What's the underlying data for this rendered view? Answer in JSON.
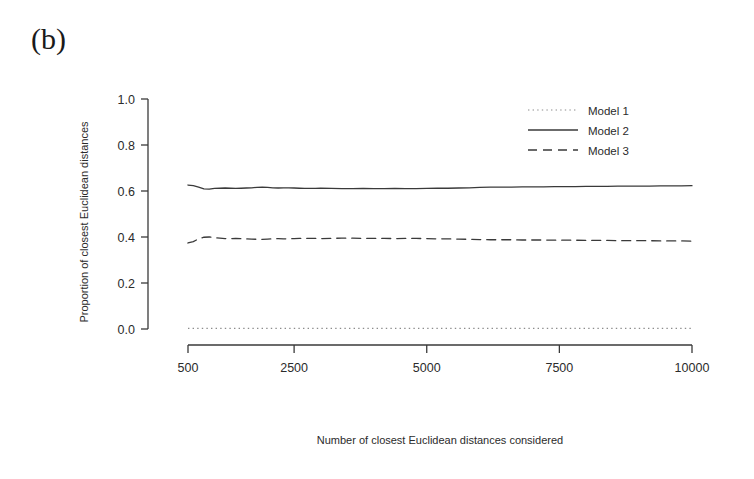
{
  "figure": {
    "panel_label": "(b)",
    "background_color": "#ffffff",
    "ink_color": "#3a3a3a"
  },
  "chart_data": {
    "type": "line",
    "title": "",
    "subtitle": "",
    "xlabel": "Number of closest Euclidean distances considered",
    "ylabel": "Proportion of closest Euclidean distances",
    "xlim": [
      500,
      10000
    ],
    "ylim": [
      0.0,
      1.0
    ],
    "grid": false,
    "legend_position": "top-right",
    "xticks": [
      500,
      2500,
      5000,
      7500,
      10000
    ],
    "xtick_labels": [
      "500",
      "2500",
      "5000",
      "7500",
      "10000"
    ],
    "yticks": [
      0.0,
      0.2,
      0.4,
      0.6,
      0.8,
      1.0
    ],
    "ytick_labels": [
      "0.0",
      "0.2",
      "0.4",
      "0.6",
      "0.8",
      "1.0"
    ],
    "x": [
      500,
      600,
      700,
      800,
      900,
      1000,
      1100,
      1200,
      1300,
      1400,
      1500,
      1600,
      1700,
      1800,
      1900,
      2000,
      2100,
      2200,
      2300,
      2400,
      2500,
      2600,
      2700,
      2800,
      2900,
      3000,
      3200,
      3400,
      3600,
      3800,
      4000,
      4200,
      4400,
      4600,
      4800,
      5000,
      5200,
      5400,
      5600,
      5800,
      6000,
      6200,
      6400,
      6600,
      6800,
      7000,
      7200,
      7400,
      7600,
      7800,
      8000,
      8200,
      8400,
      8600,
      8800,
      9000,
      9200,
      9400,
      9600,
      9800,
      10000
    ],
    "series": [
      {
        "name": "Model 1",
        "style": "dotted",
        "color": "#8c8c8c",
        "values": [
          0.003,
          0.003,
          0.003,
          0.003,
          0.003,
          0.003,
          0.003,
          0.003,
          0.003,
          0.003,
          0.003,
          0.003,
          0.003,
          0.003,
          0.003,
          0.003,
          0.003,
          0.003,
          0.003,
          0.003,
          0.003,
          0.003,
          0.003,
          0.003,
          0.003,
          0.003,
          0.003,
          0.003,
          0.003,
          0.003,
          0.003,
          0.003,
          0.003,
          0.003,
          0.003,
          0.003,
          0.003,
          0.003,
          0.003,
          0.003,
          0.003,
          0.003,
          0.003,
          0.003,
          0.003,
          0.003,
          0.003,
          0.003,
          0.003,
          0.003,
          0.003,
          0.003,
          0.003,
          0.003,
          0.003,
          0.003,
          0.003,
          0.003,
          0.003,
          0.003,
          0.003
        ]
      },
      {
        "name": "Model 2",
        "style": "solid",
        "color": "#3a3a3a",
        "values": [
          0.626,
          0.623,
          0.617,
          0.609,
          0.608,
          0.611,
          0.612,
          0.613,
          0.612,
          0.611,
          0.612,
          0.613,
          0.614,
          0.616,
          0.617,
          0.616,
          0.614,
          0.613,
          0.614,
          0.614,
          0.613,
          0.612,
          0.611,
          0.611,
          0.611,
          0.612,
          0.611,
          0.61,
          0.61,
          0.611,
          0.61,
          0.61,
          0.611,
          0.61,
          0.61,
          0.611,
          0.612,
          0.612,
          0.613,
          0.614,
          0.616,
          0.617,
          0.617,
          0.617,
          0.618,
          0.618,
          0.618,
          0.619,
          0.619,
          0.619,
          0.62,
          0.62,
          0.62,
          0.621,
          0.621,
          0.621,
          0.621,
          0.622,
          0.622,
          0.622,
          0.623
        ]
      },
      {
        "name": "Model 3",
        "style": "dashed",
        "color": "#3a3a3a",
        "values": [
          0.374,
          0.38,
          0.392,
          0.399,
          0.4,
          0.397,
          0.395,
          0.393,
          0.393,
          0.394,
          0.393,
          0.392,
          0.391,
          0.39,
          0.39,
          0.391,
          0.392,
          0.393,
          0.392,
          0.392,
          0.393,
          0.394,
          0.394,
          0.394,
          0.394,
          0.393,
          0.394,
          0.395,
          0.395,
          0.394,
          0.394,
          0.394,
          0.393,
          0.394,
          0.394,
          0.393,
          0.392,
          0.392,
          0.391,
          0.39,
          0.389,
          0.388,
          0.388,
          0.388,
          0.387,
          0.387,
          0.387,
          0.386,
          0.386,
          0.386,
          0.385,
          0.385,
          0.385,
          0.384,
          0.384,
          0.384,
          0.384,
          0.383,
          0.383,
          0.383,
          0.382
        ]
      }
    ],
    "legend": [
      {
        "label": "Model 1",
        "style": "dotted"
      },
      {
        "label": "Model 2",
        "style": "solid"
      },
      {
        "label": "Model 3",
        "style": "dashed"
      }
    ]
  }
}
